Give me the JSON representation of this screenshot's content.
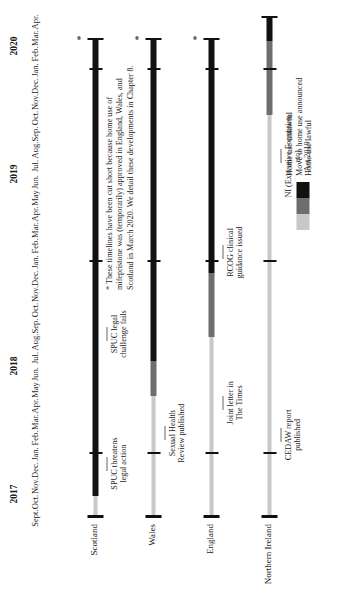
{
  "chart_data": {
    "type": "bar",
    "title": "",
    "xlabel": "",
    "ylabel": "",
    "orientation": "horizontal-timeline",
    "axis_start": "Sept. 2017",
    "axis_end": "Apr. 2020",
    "months": [
      "Sept.",
      "Oct.",
      "Nov.",
      "Dec.",
      "Jan.",
      "Feb.",
      "Mar.",
      "Apr.",
      "May",
      "Jun.",
      "Jul.",
      "Aug.",
      "Sep.",
      "Oct.",
      "Nov.",
      "Dec.",
      "Jan.",
      "Feb.",
      "Mar.",
      "Apr.",
      "May",
      "Jun.",
      "Jul.",
      "Aug.",
      "Sep.",
      "Oct.",
      "Nov.",
      "Dec.",
      "Jan.",
      "Feb.",
      "Mar.",
      "Apr."
    ],
    "years": [
      {
        "label": "2017",
        "start_index": 0,
        "end_index": 3
      },
      {
        "label": "2018",
        "start_index": 4,
        "end_index": 15
      },
      {
        "label": "2019",
        "start_index": 16,
        "end_index": 27
      },
      {
        "label": "2020",
        "start_index": 28,
        "end_index": 31
      }
    ],
    "year_ticks": [
      {
        "label": "Jan. 2018",
        "index": 4
      },
      {
        "label": "Jan. 2019",
        "index": 16
      },
      {
        "label": "Jan. 2020",
        "index": 28
      }
    ],
    "categories": [
      "Scotland",
      "Wales",
      "England",
      "Northern Ireland"
    ],
    "legend": {
      "position": "bottom-right",
      "entries": [
        {
          "label": "Home use unlawful",
          "color": "#c8c8c8"
        },
        {
          "label": "Move to home use announced",
          "color": "#6e6e6e"
        },
        {
          "label": "Home use lawful",
          "color": "#111111"
        }
      ]
    },
    "series": [
      {
        "name": "Scotland",
        "truncated": true,
        "end_marker": "*",
        "segments": [
          {
            "state": "Home use unlawful",
            "color": "#c8c8c8",
            "start_index": 0,
            "end_index": 1.4
          },
          {
            "state": "Home use lawful",
            "color": "#111111",
            "start_index": 1.4,
            "end_index": 30
          }
        ],
        "annotations": [
          {
            "text": "SPUC threatens\nlegal action",
            "month": "Dec. 2017",
            "index": 3.4
          },
          {
            "text": "SPUC legal\nchallenge fails",
            "month": "Aug. 2018",
            "index": 11.5
          }
        ]
      },
      {
        "name": "Wales",
        "truncated": true,
        "end_marker": "*",
        "segments": [
          {
            "state": "Home use unlawful",
            "color": "#c8c8c8",
            "start_index": 0,
            "end_index": 7.6
          },
          {
            "state": "Move to home use announced",
            "color": "#6e6e6e",
            "start_index": 7.6,
            "end_index": 9.8
          },
          {
            "state": "Home use lawful",
            "color": "#111111",
            "start_index": 9.8,
            "end_index": 30
          }
        ],
        "annotations": [
          {
            "text": "Sexual Health\nReview published",
            "month": "Feb. 2018",
            "index": 5.3
          }
        ]
      },
      {
        "name": "England",
        "truncated": true,
        "end_marker": "*",
        "segments": [
          {
            "state": "Home use unlawful",
            "color": "#c8c8c8",
            "start_index": 0,
            "end_index": 11.3
          },
          {
            "state": "Move to home use announced",
            "color": "#6e6e6e",
            "start_index": 11.3,
            "end_index": 15.3
          },
          {
            "state": "Home use lawful",
            "color": "#111111",
            "start_index": 15.3,
            "end_index": 30
          }
        ],
        "annotations": [
          {
            "text": "Joint letter in\nThe Times",
            "month": "Apr. 2018",
            "index": 7.2
          },
          {
            "text": "RCOG clinical\nguidance issued",
            "month": "Jan. 2019",
            "index": 16.6
          }
        ]
      },
      {
        "name": "Northern Ireland",
        "truncated": false,
        "end_marker": "",
        "segments": [
          {
            "state": "Home use unlawful",
            "color": "#c8c8c8",
            "start_index": 0,
            "end_index": 25.2
          },
          {
            "state": "Move to home use announced",
            "color": "#6e6e6e",
            "start_index": 25.2,
            "end_index": 29.8
          },
          {
            "state": "Home use lawful",
            "color": "#111111",
            "start_index": 29.8,
            "end_index": 31.4
          }
        ],
        "annotations": [
          {
            "text": "CEDAW report\npublished",
            "month": "Feb. 2018",
            "index": 5.2
          },
          {
            "text": "NI (Executive Formation etc)\nAct 2019",
            "month": "Jul. 2019",
            "index": 22.6
          }
        ]
      }
    ]
  },
  "footnote": {
    "text": "* These timelines have been cut short because home use of mifepristone was (temporarily) approved in England, Wales, and Scotland in March 2020. We detail these developments in Chapter 8."
  }
}
